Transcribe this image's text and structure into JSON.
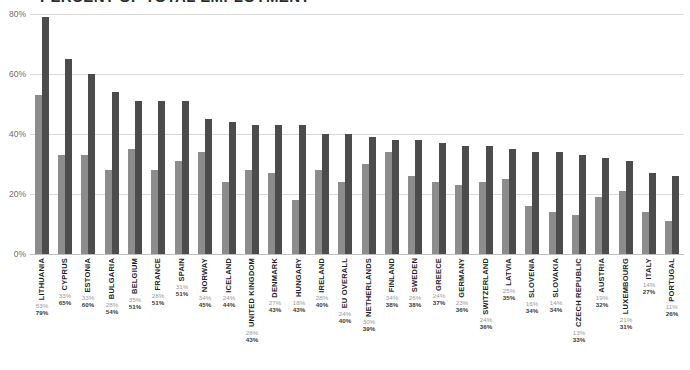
{
  "chart_data": {
    "type": "bar",
    "title": "PERCENT OF TOTAL EMPLOYMENT",
    "title_clipped": true,
    "xlabel": "",
    "ylabel": "",
    "ylim": [
      0,
      80
    ],
    "yticks": [
      "0%",
      "20%",
      "40%",
      "60%",
      "80%"
    ],
    "ytick_values": [
      0,
      20,
      40,
      60,
      80
    ],
    "grid": true,
    "legend": "none",
    "orientation": "vertical",
    "value_label_suffix": "%",
    "categories": [
      "LITHUANIA",
      "CYPRUS",
      "ESTONIA",
      "BULGARIA",
      "BELGIUM",
      "FRANCE",
      "SPAIN",
      "NORWAY",
      "ICELAND",
      "UNITED KINGDOM",
      "DENMARK",
      "HUNGARY",
      "IRELAND",
      "EU OVERALL",
      "NETHERLANDS",
      "FINLAND",
      "SWEDEN",
      "GREECE",
      "GERMANY",
      "SWITZERLAND",
      "LATVIA",
      "SLOVENIA",
      "SLOVAKIA",
      "CZECH REPUBLIC",
      "AUSTRIA",
      "LUXEMBOURG",
      "ITALY",
      "PORTUGAL"
    ],
    "series": [
      {
        "name": "series-1",
        "color": "#8c8c8c",
        "values": [
          53,
          33,
          33,
          28,
          35,
          28,
          31,
          34,
          24,
          28,
          27,
          18,
          28,
          24,
          30,
          34,
          26,
          24,
          23,
          24,
          25,
          16,
          14,
          13,
          19,
          21,
          14,
          11
        ]
      },
      {
        "name": "series-2",
        "color": "#4c4c4c",
        "values": [
          79,
          65,
          60,
          54,
          51,
          51,
          51,
          45,
          44,
          43,
          43,
          43,
          40,
          40,
          39,
          38,
          38,
          37,
          36,
          36,
          35,
          34,
          34,
          33,
          32,
          31,
          27,
          26
        ]
      }
    ],
    "value_labels": [
      {
        "category": "LITHUANIA",
        "v1": "53%",
        "v2": "79%"
      },
      {
        "category": "CYPRUS",
        "v1": "33%",
        "v2": "65%"
      },
      {
        "category": "ESTONIA",
        "v1": "33%",
        "v2": "60%"
      },
      {
        "category": "BULGARIA",
        "v1": "28%",
        "v2": "54%"
      },
      {
        "category": "BELGIUM",
        "v1": "35%",
        "v2": "51%"
      },
      {
        "category": "FRANCE",
        "v1": "28%",
        "v2": "51%"
      },
      {
        "category": "SPAIN",
        "v1": "31%",
        "v2": "51%"
      },
      {
        "category": "NORWAY",
        "v1": "34%",
        "v2": "45%"
      },
      {
        "category": "ICELAND",
        "v1": "24%",
        "v2": "44%"
      },
      {
        "category": "UNITED KINGDOM",
        "v1": "28%",
        "v2": "43%"
      },
      {
        "category": "DENMARK",
        "v1": "27%",
        "v2": "43%"
      },
      {
        "category": "HUNGARY",
        "v1": "18%",
        "v2": "43%"
      },
      {
        "category": "IRELAND",
        "v1": "28%",
        "v2": "40%"
      },
      {
        "category": "EU OVERALL",
        "v1": "24%",
        "v2": "40%"
      },
      {
        "category": "NETHERLANDS",
        "v1": "30%",
        "v2": "39%"
      },
      {
        "category": "FINLAND",
        "v1": "34%",
        "v2": "38%"
      },
      {
        "category": "SWEDEN",
        "v1": "26%",
        "v2": "38%"
      },
      {
        "category": "GREECE",
        "v1": "24%",
        "v2": "37%"
      },
      {
        "category": "GERMANY",
        "v1": "23%",
        "v2": "36%"
      },
      {
        "category": "SWITZERLAND",
        "v1": "24%",
        "v2": "36%"
      },
      {
        "category": "LATVIA",
        "v1": "25%",
        "v2": "35%"
      },
      {
        "category": "SLOVENIA",
        "v1": "16%",
        "v2": "34%"
      },
      {
        "category": "SLOVAKIA",
        "v1": "14%",
        "v2": "34%"
      },
      {
        "category": "CZECH REPUBLIC",
        "v1": "13%",
        "v2": "33%"
      },
      {
        "category": "AUSTRIA",
        "v1": "19%",
        "v2": "32%"
      },
      {
        "category": "LUXEMBOURG",
        "v1": "21%",
        "v2": "31%"
      },
      {
        "category": "ITALY",
        "v1": "14%",
        "v2": "27%"
      },
      {
        "category": "PORTUGAL",
        "v1": "11%",
        "v2": "26%"
      }
    ]
  },
  "colors": {
    "series1": "#8c8c8c",
    "series2": "#4c4c4c",
    "grid": "#d9d9d9",
    "axis_text": "#6f6f6f",
    "category_text": "#1e1e1e",
    "background": "#ffffff"
  }
}
